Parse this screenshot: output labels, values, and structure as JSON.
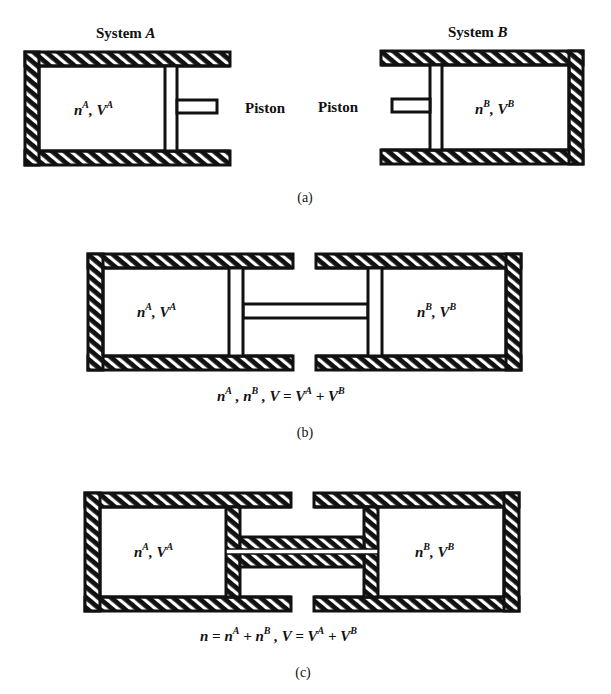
{
  "figure": {
    "panel_a": {
      "system_a_title": "System A",
      "system_a_title_text": "System ",
      "system_a_title_var": "A",
      "system_b_title_text": "System ",
      "system_b_title_var": "B",
      "system_a_state": {
        "n": "n",
        "n_sup": "A",
        "sep": ", ",
        "v": "V",
        "v_sup": "A"
      },
      "system_b_state": {
        "n": "n",
        "n_sup": "B",
        "sep": ", ",
        "v": "V",
        "v_sup": "B"
      },
      "piston_label_left": "Piston",
      "piston_label_right": "Piston",
      "caption": "(a)"
    },
    "panel_b": {
      "left_state": {
        "n": "n",
        "n_sup": "A",
        "sep": ", ",
        "v": "V",
        "v_sup": "A"
      },
      "right_state": {
        "n": "n",
        "n_sup": "B",
        "sep": ", ",
        "v": "V",
        "v_sup": "B"
      },
      "equation": {
        "t1": "n",
        "t1_sup": "A",
        "s1": " , ",
        "t2": "n",
        "t2_sup": "B",
        "s2": " , ",
        "t3": "V = V",
        "t3_sup": "A",
        "s3": " + ",
        "t4": "V",
        "t4_sup": "B"
      },
      "equation_text": "nA , nB , V = VA + VB",
      "caption": "(b)"
    },
    "panel_c": {
      "left_state": {
        "n": "n",
        "n_sup": "A",
        "sep": ", ",
        "v": "V",
        "v_sup": "A"
      },
      "right_state": {
        "n": "n",
        "n_sup": "B",
        "sep": ", ",
        "v": "V",
        "v_sup": "B"
      },
      "equation": {
        "t1": "n = n",
        "t1_sup": "A",
        "s1": " + ",
        "t2": "n",
        "t2_sup": "B",
        "s2": " , ",
        "t3": "V = V",
        "t3_sup": "A",
        "s3": " + ",
        "t4": "V",
        "t4_sup": "B"
      },
      "equation_text": "n = nA + nB , V = VA + VB",
      "caption": "(c)"
    },
    "colors": {
      "ink": "#111111",
      "paper": "#ffffff"
    }
  }
}
